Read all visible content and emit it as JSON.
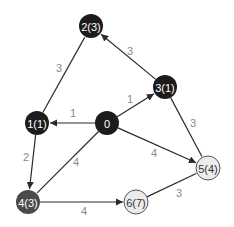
{
  "diagram": {
    "type": "weighted-directed-graph",
    "node_radius": 12,
    "colors": {
      "visited_fill": "#1c1c1c",
      "current_fill": "#4a4a4a",
      "unvisited_fill": "#ececec",
      "unvisited_stroke": "#555555",
      "edge": "#2a2a2a",
      "edge_label": "#8a8a8a",
      "light_text": "#ffffff",
      "dark_text": "#333333"
    },
    "nodes": [
      {
        "id": "0",
        "label": "0",
        "x": 107,
        "y": 123,
        "state": "visited"
      },
      {
        "id": "1",
        "label": "1(1)",
        "x": 37,
        "y": 123,
        "state": "visited"
      },
      {
        "id": "2",
        "label": "2(3)",
        "x": 91,
        "y": 26,
        "state": "visited"
      },
      {
        "id": "3",
        "label": "3(1)",
        "x": 165,
        "y": 87,
        "state": "visited"
      },
      {
        "id": "4",
        "label": "4(3)",
        "x": 28,
        "y": 202,
        "state": "current"
      },
      {
        "id": "5",
        "label": "5(4)",
        "x": 208,
        "y": 168,
        "state": "unvisited"
      },
      {
        "id": "6",
        "label": "6(7)",
        "x": 136,
        "y": 202,
        "state": "unvisited"
      }
    ],
    "edges": [
      {
        "from": "0",
        "to": "1",
        "weight": "1",
        "arrow": true,
        "lx": 73,
        "ly": 113
      },
      {
        "from": "0",
        "to": "3",
        "weight": "1",
        "arrow": true,
        "lx": 130,
        "ly": 99
      },
      {
        "from": "0",
        "to": "5",
        "weight": "4",
        "arrow": true,
        "lx": 154,
        "ly": 153
      },
      {
        "from": "0",
        "to": "4",
        "weight": "4",
        "arrow": false,
        "lx": 76,
        "ly": 162
      },
      {
        "from": "1",
        "to": "2",
        "weight": "3",
        "arrow": false,
        "lx": 59,
        "ly": 68
      },
      {
        "from": "3",
        "to": "2",
        "weight": "3",
        "arrow": true,
        "lx": 130,
        "ly": 51
      },
      {
        "from": "1",
        "to": "4",
        "weight": "2",
        "arrow": true,
        "lx": 26,
        "ly": 157
      },
      {
        "from": "3",
        "to": "5",
        "weight": "3",
        "arrow": false,
        "lx": 193,
        "ly": 123
      },
      {
        "from": "4",
        "to": "6",
        "weight": "4",
        "arrow": true,
        "lx": 84,
        "ly": 211
      },
      {
        "from": "6",
        "to": "5",
        "weight": "3",
        "arrow": false,
        "lx": 179,
        "ly": 193
      }
    ]
  }
}
